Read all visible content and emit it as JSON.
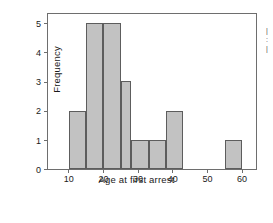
{
  "figure": {
    "background": "#ffffff",
    "frame_color": "#6e6e6e",
    "edge_fragment_lines": [
      "|",
      ":",
      "|"
    ]
  },
  "chart_data": {
    "type": "bar",
    "title": "",
    "subtitle": "",
    "xlabel": "Age at first arrest",
    "ylabel": "Frequency",
    "xlim": [
      4,
      64
    ],
    "ylim": [
      0,
      5.3
    ],
    "xticks": [
      10,
      20,
      30,
      40,
      50,
      60
    ],
    "xtick_labels": [
      "10",
      "20",
      "30",
      "40",
      "50",
      "60"
    ],
    "yticks": [
      0,
      1,
      2,
      3,
      4,
      5
    ],
    "ytick_labels": [
      "0",
      "1",
      "2",
      "3",
      "4",
      "5"
    ],
    "grid": false,
    "legend": null,
    "bin_width": 5,
    "bar_fill": "#c2c2c2",
    "bar_edge": "#5d5d5d",
    "bins": [
      {
        "left": 10,
        "right": 15,
        "value": 2
      },
      {
        "left": 15,
        "right": 20,
        "value": 5
      },
      {
        "left": 20,
        "right": 25,
        "value": 5
      },
      {
        "left": 25,
        "right": 28,
        "value": 3
      },
      {
        "left": 28,
        "right": 33,
        "value": 1
      },
      {
        "left": 33,
        "right": 38,
        "value": 1
      },
      {
        "left": 38,
        "right": 43,
        "value": 2
      },
      {
        "left": 55,
        "right": 60,
        "value": 1
      }
    ],
    "categories": [
      "10-15",
      "15-20",
      "20-25",
      "25-28",
      "28-33",
      "33-38",
      "38-43",
      "55-60"
    ],
    "values": [
      2,
      5,
      5,
      3,
      1,
      1,
      2,
      1
    ]
  }
}
